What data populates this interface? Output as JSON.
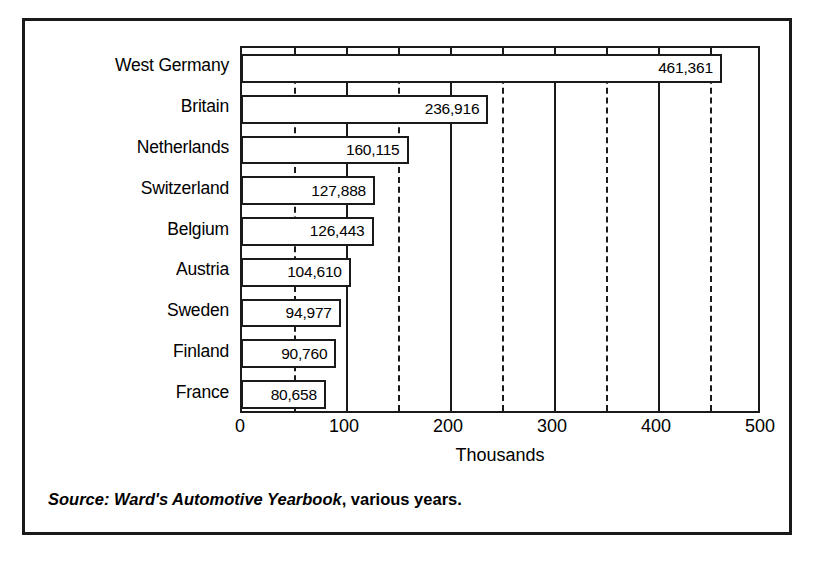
{
  "chart_data": {
    "type": "bar",
    "orientation": "horizontal",
    "title": "",
    "xlabel": "Thousands",
    "ylabel": "",
    "xlim": [
      0,
      500
    ],
    "categories": [
      "West Germany",
      "Britain",
      "Netherlands",
      "Switzerland",
      "Belgium",
      "Austria",
      "Sweden",
      "Finland",
      "France"
    ],
    "values": [
      461361,
      236916,
      160115,
      127888,
      126443,
      104610,
      94977,
      90760,
      80658
    ],
    "value_labels": [
      "461,361",
      "236,916",
      "160,115",
      "127,888",
      "126,443",
      "104,610",
      "94,977",
      "90,760",
      "80,658"
    ],
    "value_unit_divisor": 1000,
    "x_tick_values": [
      0,
      100,
      200,
      300,
      400,
      500
    ],
    "x_tick_labels": [
      "0",
      "100",
      "200",
      "300",
      "400",
      "500"
    ],
    "x_minor_tick_values": [
      50,
      150,
      250,
      350,
      450
    ],
    "grid": {
      "major_gridlines": [
        100,
        200,
        300,
        400
      ],
      "major_style": "solid",
      "minor_gridlines": [
        50,
        150,
        250,
        350,
        450
      ],
      "minor_style": "dashed"
    },
    "legend": null,
    "bar_fill_color": "#ffffff",
    "bar_edge_color": "#1a1a1a",
    "background_color": "#ffffff"
  },
  "source": {
    "italic_part": "Source: Ward's Automotive Yearbook",
    "upright_part": ", various years."
  }
}
